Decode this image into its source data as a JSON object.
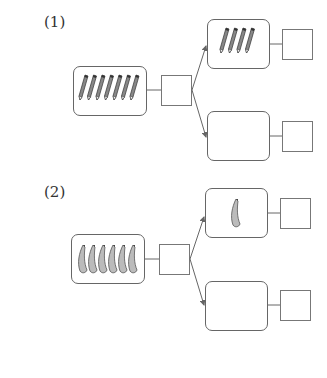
{
  "problems": [
    {
      "label": "(1)",
      "item": "pencil",
      "total_count": 7,
      "top_part_count": 4,
      "bottom_part_count": null,
      "answer_boxes": [
        "",
        "",
        ""
      ]
    },
    {
      "label": "(2)",
      "item": "banana",
      "total_count": 6,
      "top_part_count": 1,
      "bottom_part_count": null,
      "answer_boxes": [
        "",
        "",
        ""
      ]
    }
  ],
  "colors": {
    "line": "#666666",
    "item": "#555555"
  }
}
